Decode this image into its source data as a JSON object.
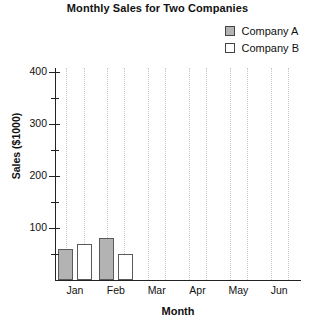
{
  "chart_data": {
    "type": "bar",
    "title": "Monthly Sales for Two Companies",
    "xlabel": "Month",
    "ylabel": "Sales ($1000)",
    "categories": [
      "Jan",
      "Feb",
      "Mar",
      "Apr",
      "May",
      "Jun"
    ],
    "series": [
      {
        "name": "Company A",
        "values": [
          60,
          80,
          0,
          0,
          0,
          0
        ],
        "color": "#b3b3b3"
      },
      {
        "name": "Company B",
        "values": [
          70,
          50,
          0,
          0,
          0,
          0
        ],
        "color": "#ffffff"
      }
    ],
    "ylim": [
      0,
      400
    ],
    "y_major_ticks": [
      100,
      200,
      300,
      400
    ],
    "y_minor_ticks": [
      50,
      150,
      250,
      350
    ],
    "y_tick_labels": [
      "100",
      "200",
      "300",
      "400"
    ],
    "grid": "vertical-dotted",
    "legend_position": "top-right",
    "bar_border_color": "#5a5a5a",
    "axis_color": "#222222",
    "grid_color": "#c9c9c9"
  },
  "legend": {
    "items": [
      {
        "label": "Company A"
      },
      {
        "label": "Company B"
      }
    ]
  },
  "axis": {
    "y_labels": [
      "400",
      "300",
      "200",
      "100"
    ],
    "x_labels": [
      "Jan",
      "Feb",
      "Mar",
      "Apr",
      "May",
      "Jun"
    ]
  }
}
